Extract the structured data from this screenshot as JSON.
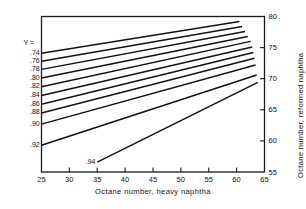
{
  "chart_data": {
    "type": "line",
    "title": "",
    "xlabel": "Octane number, heavy naphtha",
    "ylabel": "Octane number, reformed naphtha",
    "xlim": [
      25,
      65
    ],
    "ylim": [
      55,
      80
    ],
    "xticks": [
      25,
      30,
      35,
      40,
      45,
      50,
      55,
      60,
      65
    ],
    "xticklabels": [
      "25",
      "30",
      "35",
      "40",
      "45",
      "50",
      "55",
      "60",
      "65"
    ],
    "yticks": [
      55,
      60,
      65,
      70,
      75,
      80
    ],
    "yticklabels": [
      "55",
      "60",
      "65",
      "70",
      "75",
      "80"
    ],
    "grid": false,
    "legend_position": "inline-left",
    "series_param_label": "Y =",
    "series": [
      {
        "name": ".74",
        "label": ".74",
        "x": [
          25,
          60.5
        ],
        "values": [
          74.1,
          79.2
        ]
      },
      {
        "name": ".76",
        "label": ".76",
        "x": [
          25,
          61.0
        ],
        "values": [
          72.8,
          78.4
        ]
      },
      {
        "name": ".78",
        "label": ".78",
        "x": [
          25,
          61.5
        ],
        "values": [
          71.5,
          77.6
        ]
      },
      {
        "name": ".80",
        "label": ".80",
        "x": [
          25,
          62.0
        ],
        "values": [
          70.1,
          76.8
        ]
      },
      {
        "name": ".82",
        "label": ".82",
        "x": [
          25,
          62.5
        ],
        "values": [
          68.7,
          76.0
        ]
      },
      {
        "name": ".84",
        "label": ".84",
        "x": [
          25,
          62.8
        ],
        "values": [
          67.3,
          75.1
        ]
      },
      {
        "name": ".86",
        "label": ".86",
        "x": [
          25,
          63.0
        ],
        "values": [
          65.9,
          74.2
        ]
      },
      {
        "name": ".88",
        "label": ".88",
        "x": [
          25,
          63.2
        ],
        "values": [
          64.5,
          73.3
        ]
      },
      {
        "name": ".90",
        "label": ".90",
        "x": [
          25,
          63.4
        ],
        "values": [
          62.7,
          72.2
        ]
      },
      {
        "name": ".92",
        "label": ".92",
        "x": [
          25,
          63.6
        ],
        "values": [
          59.3,
          70.6
        ]
      },
      {
        "name": ".94",
        "label": ".94",
        "x": [
          35,
          63.8
        ],
        "values": [
          56.6,
          69.4
        ]
      }
    ]
  },
  "axes": {
    "x_axis_name": "Octane number, heavy naphtha",
    "y_axis_name": "Octane number, reformed naphtha"
  }
}
